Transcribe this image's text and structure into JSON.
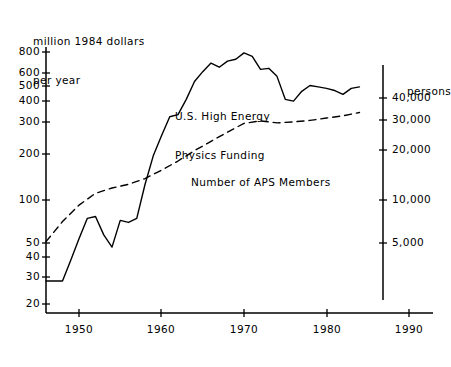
{
  "figure": {
    "left_axis_title_line1": "million 1984 dollars",
    "left_axis_title_line2": "per year",
    "right_axis_title": "persons",
    "series_label_funding_line1": "U.S. High Energy",
    "series_label_funding_line2": "Physics Funding",
    "series_label_members": "Number of APS Members",
    "ink_color": "#000000"
  },
  "chart_data": {
    "type": "line",
    "title": "",
    "xlabel": "",
    "ylabel": "million 1984 dollars per year",
    "y2label": "persons",
    "xlim": [
      1946,
      1992
    ],
    "grid": false,
    "legend": "inline-annotation",
    "yscale": "log",
    "ylim": [
      18,
      950
    ],
    "y2scale": "log",
    "y2lim": [
      3400,
      52000
    ],
    "xticks": [
      1950,
      1960,
      1970,
      1980,
      1990
    ],
    "xticklabels": [
      "1950",
      "1960",
      "1970",
      "1980",
      "1990"
    ],
    "yticks": [
      20,
      30,
      40,
      50,
      100,
      200,
      300,
      400,
      500,
      600,
      800
    ],
    "yticklabels": [
      "20",
      "30",
      "40",
      "50",
      "100",
      "200",
      "300",
      "400",
      "500",
      "600",
      "800"
    ],
    "y2ticks": [
      5000,
      10000,
      20000,
      30000,
      40000
    ],
    "y2ticklabels": [
      "5,000",
      "10,000",
      "20,000",
      "30,000",
      "40,000"
    ],
    "series": [
      {
        "name": "U.S. High Energy Physics Funding",
        "axis": "left",
        "style": "solid",
        "units": "million 1984 dollars per year",
        "x": [
          1946,
          1947,
          1948,
          1949,
          1950,
          1951,
          1952,
          1953,
          1954,
          1955,
          1956,
          1957,
          1958,
          1959,
          1960,
          1961,
          1962,
          1963,
          1964,
          1965,
          1966,
          1967,
          1968,
          1969,
          1970,
          1971,
          1972,
          1973,
          1974,
          1975,
          1976,
          1977,
          1978,
          1979,
          1980,
          1981,
          1982,
          1983,
          1984
        ],
        "y": [
          28,
          28,
          28,
          38,
          52,
          70,
          72,
          55,
          46,
          68,
          66,
          70,
          115,
          175,
          235,
          310,
          320,
          400,
          520,
          600,
          680,
          640,
          700,
          720,
          790,
          750,
          620,
          630,
          560,
          400,
          390,
          450,
          490,
          480,
          470,
          455,
          430,
          470,
          480
        ]
      },
      {
        "name": "Number of APS Members",
        "axis": "right",
        "style": "dashed",
        "units": "persons",
        "x": [
          1946,
          1948,
          1950,
          1952,
          1954,
          1956,
          1958,
          1960,
          1962,
          1964,
          1966,
          1968,
          1970,
          1972,
          1974,
          1976,
          1978,
          1980,
          1982,
          1984
        ],
        "y": [
          5100,
          6800,
          8600,
          10200,
          11000,
          11600,
          12600,
          14200,
          16200,
          18800,
          21500,
          24500,
          27800,
          28800,
          28000,
          28400,
          29000,
          30000,
          31000,
          32500
        ]
      }
    ],
    "annotations": [
      {
        "text": "U.S. High Energy Physics Funding",
        "x": 1962,
        "y": 420
      },
      {
        "text": "Number of APS Members",
        "x": 1962,
        "y": 150
      }
    ]
  },
  "axis_labels": {
    "y_left": [
      {
        "value": "800",
        "px": 52
      },
      {
        "value": "600",
        "px": 73
      },
      {
        "value": "500",
        "px": 86
      },
      {
        "value": "400",
        "px": 101
      },
      {
        "value": "300",
        "px": 122
      },
      {
        "value": "200",
        "px": 154
      },
      {
        "value": "100",
        "px": 200
      },
      {
        "value": "50",
        "px": 243
      },
      {
        "value": "40",
        "px": 257
      },
      {
        "value": "30",
        "px": 277
      },
      {
        "value": "20",
        "px": 304
      }
    ],
    "y_right": [
      {
        "value": "40,000",
        "px": 98
      },
      {
        "value": "30,000",
        "px": 120
      },
      {
        "value": "20,000",
        "px": 150
      },
      {
        "value": "10,000",
        "px": 200
      },
      {
        "value": "5,000",
        "px": 243
      }
    ],
    "x_bottom": [
      {
        "value": "1950",
        "px": 79
      },
      {
        "value": "1960",
        "px": 161
      },
      {
        "value": "1970",
        "px": 244
      },
      {
        "value": "1980",
        "px": 327
      },
      {
        "value": "1990",
        "px": 409
      }
    ]
  }
}
